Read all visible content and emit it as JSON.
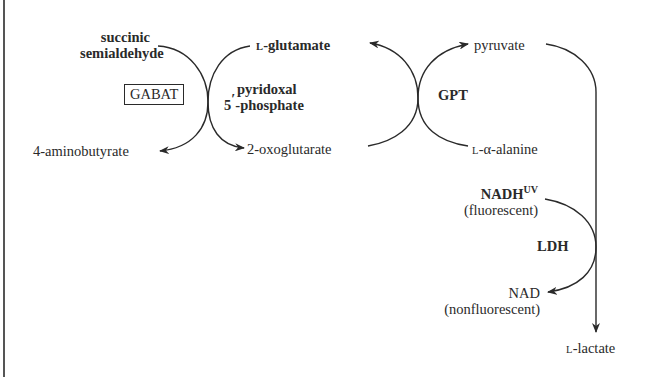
{
  "diagram": {
    "title": "",
    "nodes": {
      "succinic_semialdehyde": [
        "succinic",
        "semialdehyde"
      ],
      "aminobutyrate": "4-aminobutyrate",
      "glutamate_prefix": "L",
      "glutamate": "-glutamate",
      "oxoglutarate": "2-oxoglutarate",
      "pyruvate": "pyruvate",
      "alanine_prefix": "L",
      "alanine": "-α-alanine",
      "nadh": "NADH",
      "nadh_sup": "UV",
      "nadh_note": "(fluorescent)",
      "nad": "NAD",
      "nad_note": "(nonfluorescent)",
      "lactate_prefix": "L",
      "lactate": "-lactate"
    },
    "enzymes": {
      "gabat": "GABAT",
      "gpt": "GPT",
      "ldh": "LDH"
    },
    "cofactor": {
      "line1": "pyridoxal",
      "line2_prefix": "5",
      "line2_prime": "′",
      "line2": "-phosphate"
    },
    "colors": {
      "ink": "#2a2a2a",
      "frame": "#555555",
      "background": "#ffffff"
    }
  }
}
